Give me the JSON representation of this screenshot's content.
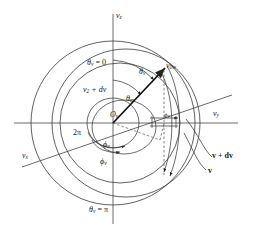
{
  "figure": {
    "kind": "velocity-space-spherical-coordinates-diagram",
    "background": "#ffffff",
    "stroke": "#333333",
    "axes": {
      "vz_label": "v",
      "vz_sub": "z",
      "vy_label": "v",
      "vy_sub": "y",
      "vx_label": "v",
      "vx_sub": "x"
    },
    "labels": {
      "theta_top": "θ",
      "theta_top_sub": "v",
      "theta_top_eq": " = 0",
      "theta_bottom": "θ",
      "theta_bottom_sub": "v",
      "theta_bottom_eq": " = π",
      "two_pi": "2π",
      "origin": "O",
      "origin_sub": "v",
      "v2_plus_dv": "v",
      "v2_plus_dv_sub": "2",
      "v2_plus_dv_rest": " + dv",
      "theta_v": "θ",
      "theta_v_sub": "v",
      "theta_m": "θ",
      "theta_m_sub": "m",
      "phi_v_upper": "ϕ",
      "phi_v_upper_sub": "v",
      "phi_v_lower": "ϕ",
      "phi_v_lower_sub": "v",
      "phi_small": "ϕ",
      "phi_small_sub": "v",
      "v_0w": "v",
      "v_0w_sub": "0w",
      "vec_v_plus_dv": "v + dv",
      "vec_v": "v"
    }
  }
}
